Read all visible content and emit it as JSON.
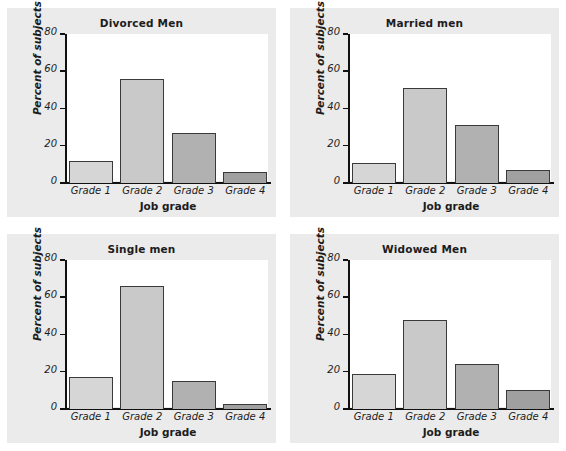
{
  "figure": {
    "background_color": "#ffffff",
    "panel_background_color": "#ebebeb",
    "plot_background_color": "#ffffff",
    "axis_color": "#111111"
  },
  "chart_data": [
    {
      "type": "bar",
      "title": "Divorced Men",
      "xlabel": "Job grade",
      "ylabel": "Percent of subjects",
      "categories": [
        "Grade 1",
        "Grade 2",
        "Grade 3",
        "Grade 4"
      ],
      "values": [
        12,
        56,
        27,
        6
      ],
      "yticks": [
        0,
        20,
        40,
        60,
        80
      ],
      "ylim": [
        0,
        80
      ],
      "grid": false,
      "legend": "none",
      "bar_colors": [
        "#d6d6d6",
        "#c9c9c9",
        "#b1b1b1",
        "#a0a0a0"
      ]
    },
    {
      "type": "bar",
      "title": "Married men",
      "xlabel": "Job grade",
      "ylabel": "Percent of subjects",
      "categories": [
        "Grade 1",
        "Grade 2",
        "Grade 3",
        "Grade 4"
      ],
      "values": [
        11,
        51,
        31,
        7
      ],
      "yticks": [
        0,
        20,
        40,
        60,
        80
      ],
      "ylim": [
        0,
        80
      ],
      "grid": false,
      "legend": "none",
      "bar_colors": [
        "#d6d6d6",
        "#c9c9c9",
        "#b1b1b1",
        "#a0a0a0"
      ]
    },
    {
      "type": "bar",
      "title": "Single men",
      "xlabel": "Job grade",
      "ylabel": "Percent of subjects",
      "categories": [
        "Grade 1",
        "Grade 2",
        "Grade 3",
        "Grade 4"
      ],
      "values": [
        17,
        66,
        15,
        2.5
      ],
      "yticks": [
        0,
        20,
        40,
        60,
        80
      ],
      "ylim": [
        0,
        80
      ],
      "grid": false,
      "legend": "none",
      "bar_colors": [
        "#d6d6d6",
        "#c9c9c9",
        "#b1b1b1",
        "#a0a0a0"
      ]
    },
    {
      "type": "bar",
      "title": "Widowed Men",
      "xlabel": "Job grade",
      "ylabel": "Percent of subjects",
      "categories": [
        "Grade 1",
        "Grade 2",
        "Grade 3",
        "Grade 4"
      ],
      "values": [
        19,
        48,
        24,
        10
      ],
      "yticks": [
        0,
        20,
        40,
        60,
        80
      ],
      "ylim": [
        0,
        80
      ],
      "grid": false,
      "legend": "none",
      "bar_colors": [
        "#d6d6d6",
        "#c9c9c9",
        "#b1b1b1",
        "#a0a0a0"
      ]
    }
  ]
}
